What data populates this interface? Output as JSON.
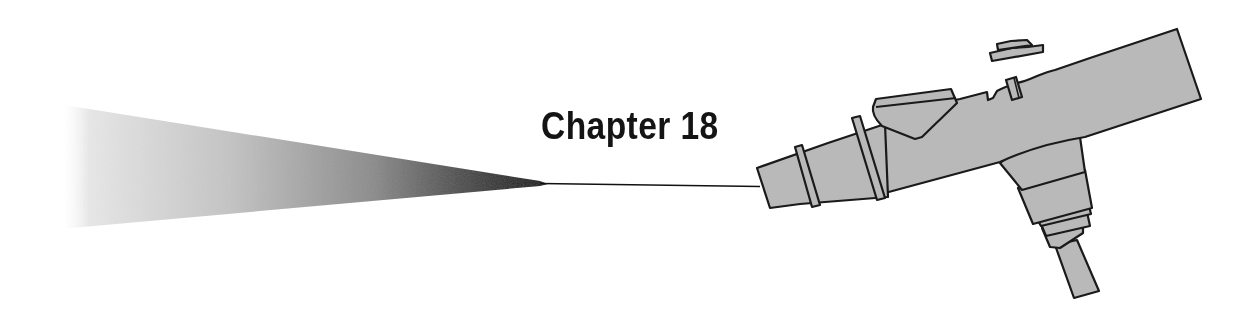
{
  "chapter": {
    "label": "Chapter 18"
  },
  "illustration": {
    "subject": "airbrush-spraying-icon",
    "body_color": "#b8b8b8",
    "outline_color": "#1a1a1a",
    "spray_color_dark": "#111111",
    "spray_color_light": "#f2f2f2"
  }
}
